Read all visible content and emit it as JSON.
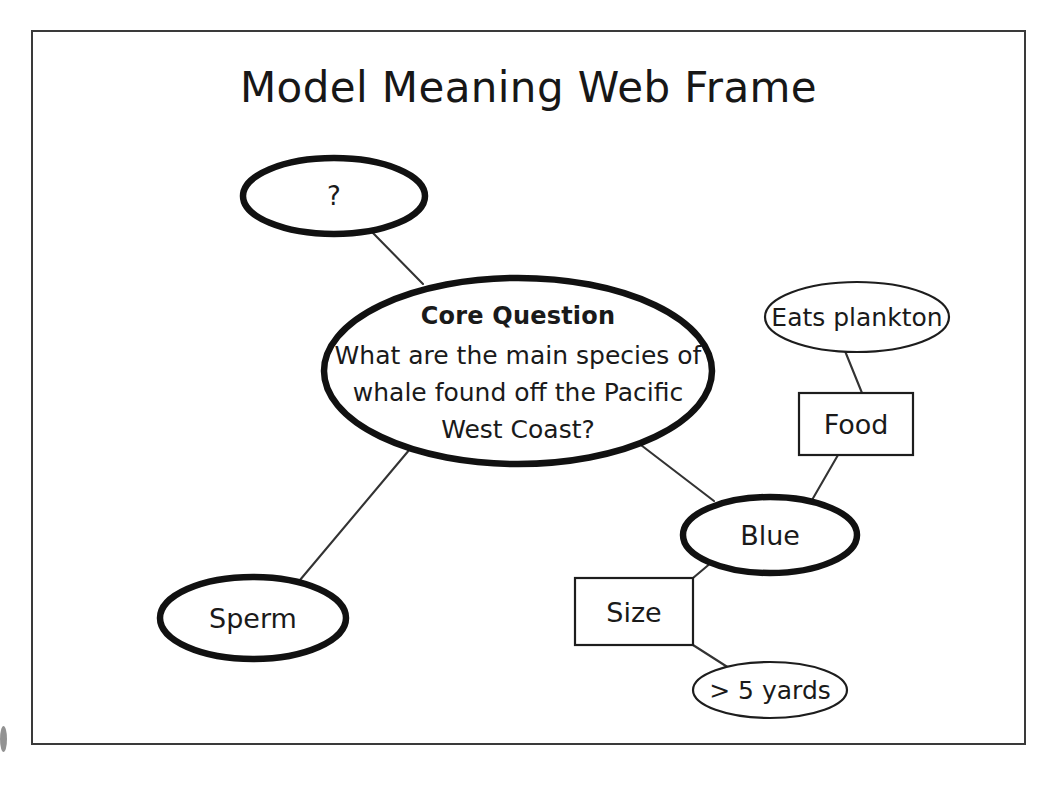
{
  "document": {
    "title": "Model Meaning Web Frame",
    "background_color": "#ffffff",
    "frame_border_color": "#3a3a3a",
    "ink_color": "#111111"
  },
  "diagram": {
    "type": "concept-map",
    "nodes": [
      {
        "id": "unknown",
        "label": "?",
        "shape": "ellipse",
        "emphasis": "thick",
        "cx": 334,
        "cy": 196,
        "rx": 91,
        "ry": 38
      },
      {
        "id": "core-question",
        "label_heading": "Core Question",
        "label_line1": "What are the main species of",
        "label_line2": "whale found off the Pacific",
        "label_line3": "West Coast?",
        "shape": "ellipse",
        "emphasis": "thick",
        "cx": 518,
        "cy": 371,
        "rx": 194,
        "ry": 93
      },
      {
        "id": "eats-plankton",
        "label": "Eats plankton",
        "shape": "ellipse",
        "emphasis": "thin",
        "cx": 857,
        "cy": 317,
        "rx": 92,
        "ry": 35
      },
      {
        "id": "food",
        "label": "Food",
        "shape": "rect",
        "emphasis": "thin",
        "x": 799,
        "y": 393,
        "width": 114,
        "height": 62
      },
      {
        "id": "blue",
        "label": "Blue",
        "shape": "ellipse",
        "emphasis": "thick",
        "cx": 770,
        "cy": 535,
        "rx": 87,
        "ry": 38
      },
      {
        "id": "size",
        "label": "Size",
        "shape": "rect",
        "emphasis": "thin",
        "x": 575,
        "y": 578,
        "width": 118,
        "height": 67
      },
      {
        "id": "five-yards",
        "label": "> 5 yards",
        "shape": "ellipse",
        "emphasis": "thin",
        "cx": 770,
        "cy": 690,
        "rx": 77,
        "ry": 28
      },
      {
        "id": "sperm",
        "label": "Sperm",
        "shape": "ellipse",
        "emphasis": "thick",
        "cx": 253,
        "cy": 618,
        "rx": 93,
        "ry": 41
      }
    ],
    "edges": [
      {
        "id": "edge-unknown-core",
        "from": "unknown",
        "to": "core-question",
        "x1": 372,
        "y1": 232,
        "x2": 423,
        "y2": 284
      },
      {
        "id": "edge-core-sperm",
        "from": "core-question",
        "to": "sperm",
        "x1": 410,
        "y1": 449,
        "x2": 300,
        "y2": 580
      },
      {
        "id": "edge-core-blue",
        "from": "core-question",
        "to": "blue",
        "x1": 637,
        "y1": 442,
        "x2": 714,
        "y2": 501
      },
      {
        "id": "edge-plankton-food",
        "from": "eats-plankton",
        "to": "food",
        "x1": 845,
        "y1": 351,
        "x2": 862,
        "y2": 393
      },
      {
        "id": "edge-food-blue",
        "from": "food",
        "to": "blue",
        "x1": 838,
        "y1": 455,
        "x2": 812,
        "y2": 500
      },
      {
        "id": "edge-blue-size",
        "from": "blue",
        "to": "size",
        "x1": 712,
        "y1": 562,
        "x2": 693,
        "y2": 578
      },
      {
        "id": "edge-size-fiveyards",
        "from": "size",
        "to": "five-yards",
        "x1": 693,
        "y1": 645,
        "x2": 729,
        "y2": 668
      }
    ]
  }
}
